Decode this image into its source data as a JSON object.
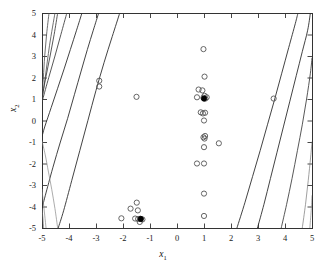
{
  "figure": {
    "background": "#ffffff",
    "frame": {
      "left": 42,
      "top": 13,
      "right": 312,
      "bottom": 228,
      "color": "#333333"
    }
  },
  "axes": {
    "x": {
      "title": "x",
      "subscript": "1",
      "ticks": [
        "-5",
        "-4",
        "-3",
        "-2",
        "-1",
        "0",
        "1",
        "2",
        "3",
        "4",
        "5"
      ],
      "range": [
        -5,
        5
      ]
    },
    "y": {
      "title": "x",
      "subscript": "2",
      "ticks": [
        "5",
        "4",
        "3",
        "2",
        "1",
        "0",
        "-1",
        "-2",
        "-3",
        "-4",
        "-5"
      ],
      "range": [
        -5,
        5
      ]
    }
  },
  "chart_data": {
    "type": "scatter",
    "title": "",
    "xlabel": "x1",
    "ylabel": "x2",
    "xlim": [
      -5,
      5
    ],
    "ylim": [
      -5,
      5
    ],
    "grid": false,
    "legend": "none",
    "marker_style": {
      "open_marker_color": "#555555",
      "filled_marker_color": "#000000",
      "marker_radius": 2.6,
      "marker_linewidth": 0.9
    },
    "series": [
      {
        "name": "data points (open circles)",
        "marker": "open-circle",
        "points": [
          [
            -2.88,
            1.85
          ],
          [
            -2.88,
            1.58
          ],
          [
            -1.5,
            1.1
          ],
          [
            -2.06,
            -4.55
          ],
          [
            -1.72,
            -4.1
          ],
          [
            -1.49,
            -3.82
          ],
          [
            -1.45,
            -4.18
          ],
          [
            -1.55,
            -4.56
          ],
          [
            -1.44,
            -4.58
          ],
          [
            -1.36,
            -4.57
          ],
          [
            -1.28,
            -4.6
          ],
          [
            -1.38,
            -4.72
          ],
          [
            0.98,
            3.32
          ],
          [
            1.02,
            2.04
          ],
          [
            0.8,
            1.44
          ],
          [
            0.94,
            1.4
          ],
          [
            0.74,
            1.08
          ],
          [
            0.98,
            1.06
          ],
          [
            1.05,
            1.02
          ],
          [
            1.1,
            1.08
          ],
          [
            1.02,
            1.15
          ],
          [
            0.88,
            0.38
          ],
          [
            0.96,
            0.33
          ],
          [
            1.04,
            0.36
          ],
          [
            1.0,
            0.0
          ],
          [
            0.98,
            -0.78
          ],
          [
            1.04,
            -0.72
          ],
          [
            1.02,
            -0.84
          ],
          [
            1.55,
            -1.06
          ],
          [
            1.0,
            -1.24
          ],
          [
            0.74,
            -2.0
          ],
          [
            1.0,
            -2.0
          ],
          [
            1.0,
            -3.4
          ],
          [
            1.0,
            -4.44
          ],
          [
            3.58,
            1.02
          ]
        ]
      },
      {
        "name": "highlighted points (filled circles)",
        "marker": "filled-circle",
        "points": [
          [
            1.0,
            1.02
          ],
          [
            -1.34,
            -4.58
          ]
        ]
      }
    ],
    "curves": [
      {
        "name": "boundary-left-outer",
        "color": "#4a4a4a",
        "width": 0.8,
        "points": [
          [
            -4.74,
            5.0
          ],
          [
            -4.83,
            4.0
          ],
          [
            -4.9,
            3.0
          ],
          [
            -4.95,
            2.0
          ],
          [
            -5.0,
            1.2
          ]
        ]
      },
      {
        "name": "boundary-left-mid-a",
        "color": "#4a4a4a",
        "width": 0.8,
        "points": [
          [
            -4.52,
            5.0
          ],
          [
            -4.72,
            3.5
          ],
          [
            -4.88,
            2.0
          ],
          [
            -5.0,
            0.9
          ]
        ]
      },
      {
        "name": "boundary-left-1",
        "color": "#3a3a3a",
        "width": 0.85,
        "points": [
          [
            -4.42,
            5.0
          ],
          [
            -4.55,
            4.0
          ],
          [
            -4.7,
            3.0
          ],
          [
            -4.86,
            2.0
          ],
          [
            -5.0,
            1.1
          ]
        ]
      },
      {
        "name": "boundary-left-2",
        "color": "#3a3a3a",
        "width": 0.85,
        "points": [
          [
            -4.08,
            5.0
          ],
          [
            -4.3,
            4.0
          ],
          [
            -4.52,
            3.0
          ],
          [
            -4.75,
            2.0
          ],
          [
            -4.97,
            1.0
          ],
          [
            -5.0,
            0.85
          ]
        ]
      },
      {
        "name": "boundary-left-3",
        "color": "#2e2e2e",
        "width": 0.9,
        "points": [
          [
            -3.52,
            5.0
          ],
          [
            -3.72,
            4.2
          ],
          [
            -3.95,
            3.3
          ],
          [
            -4.18,
            2.4
          ],
          [
            -4.42,
            1.5
          ],
          [
            -4.66,
            0.6
          ],
          [
            -4.9,
            -0.3
          ],
          [
            -5.0,
            -0.75
          ]
        ]
      },
      {
        "name": "boundary-left-4",
        "color": "#2e2e2e",
        "width": 0.9,
        "points": [
          [
            -2.9,
            5.0
          ],
          [
            -3.1,
            4.2
          ],
          [
            -3.32,
            3.3
          ],
          [
            -3.55,
            2.3
          ],
          [
            -3.8,
            1.2
          ],
          [
            -4.05,
            0.1
          ],
          [
            -4.32,
            -1.0
          ],
          [
            -4.6,
            -2.2
          ],
          [
            -4.88,
            -3.5
          ],
          [
            -5.0,
            -4.1
          ]
        ]
      },
      {
        "name": "boundary-left-5",
        "color": "#2e2e2e",
        "width": 0.9,
        "points": [
          [
            -2.12,
            5.0
          ],
          [
            -2.4,
            3.9
          ],
          [
            -2.7,
            2.7
          ],
          [
            -3.0,
            1.4
          ],
          [
            -3.3,
            0.0
          ],
          [
            -3.6,
            -1.4
          ],
          [
            -3.9,
            -2.8
          ],
          [
            -4.2,
            -4.2
          ],
          [
            -4.4,
            -5.0
          ]
        ]
      },
      {
        "name": "boundary-left-bottom-a",
        "color": "#888888",
        "width": 0.7,
        "points": [
          [
            -5.0,
            -0.95
          ],
          [
            -4.88,
            -1.6
          ],
          [
            -4.76,
            -2.4
          ],
          [
            -4.64,
            -3.2
          ],
          [
            -4.52,
            -4.1
          ],
          [
            -4.42,
            -5.0
          ]
        ]
      },
      {
        "name": "boundary-left-bottom-b",
        "color": "#888888",
        "width": 0.7,
        "points": [
          [
            -5.0,
            -3.2
          ],
          [
            -4.95,
            -3.8
          ],
          [
            -4.9,
            -4.4
          ],
          [
            -4.85,
            -5.0
          ]
        ]
      },
      {
        "name": "boundary-left-bottom-c",
        "color": "#777777",
        "width": 0.7,
        "points": [
          [
            -5.0,
            -4.1
          ],
          [
            -4.97,
            -4.5
          ],
          [
            -4.94,
            -5.0
          ]
        ]
      },
      {
        "name": "boundary-right-1",
        "color": "#2e2e2e",
        "width": 0.9,
        "points": [
          [
            2.22,
            -5.0
          ],
          [
            2.52,
            -3.8
          ],
          [
            2.8,
            -2.6
          ],
          [
            3.08,
            -1.4
          ],
          [
            3.35,
            -0.2
          ],
          [
            3.62,
            1.0
          ],
          [
            3.88,
            2.2
          ],
          [
            4.14,
            3.4
          ],
          [
            4.38,
            4.5
          ],
          [
            4.48,
            5.0
          ]
        ]
      },
      {
        "name": "boundary-right-2",
        "color": "#2e2e2e",
        "width": 0.9,
        "points": [
          [
            2.98,
            -5.0
          ],
          [
            3.22,
            -3.9
          ],
          [
            3.46,
            -2.7
          ],
          [
            3.7,
            -1.5
          ],
          [
            3.94,
            -0.3
          ],
          [
            4.18,
            0.9
          ],
          [
            4.42,
            2.1
          ],
          [
            4.64,
            3.2
          ],
          [
            4.84,
            4.2
          ],
          [
            4.94,
            5.0
          ]
        ]
      },
      {
        "name": "boundary-right-3",
        "color": "#3a3a3a",
        "width": 0.85,
        "points": [
          [
            3.86,
            -5.0
          ],
          [
            4.06,
            -3.9
          ],
          [
            4.26,
            -2.7
          ],
          [
            4.46,
            -1.4
          ],
          [
            4.64,
            -0.2
          ],
          [
            4.8,
            1.0
          ],
          [
            4.94,
            2.2
          ],
          [
            5.0,
            2.9
          ]
        ]
      },
      {
        "name": "boundary-right-4",
        "color": "#777777",
        "width": 0.7,
        "points": [
          [
            4.64,
            -5.0
          ],
          [
            4.76,
            -3.9
          ],
          [
            4.86,
            -2.8
          ],
          [
            4.95,
            -1.7
          ],
          [
            5.0,
            -1.0
          ]
        ]
      },
      {
        "name": "boundary-right-5",
        "color": "#888888",
        "width": 0.7,
        "points": [
          [
            4.92,
            -5.0
          ],
          [
            4.97,
            -4.2
          ],
          [
            5.0,
            -3.5
          ]
        ]
      }
    ]
  }
}
